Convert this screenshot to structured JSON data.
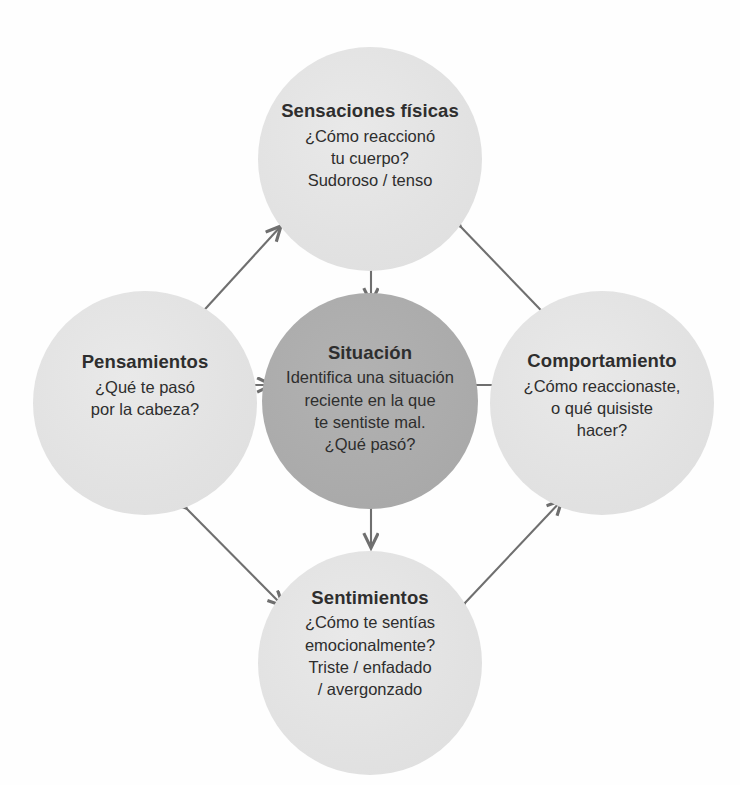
{
  "diagram": {
    "type": "cycle-diagram",
    "language": "es",
    "background_color": "#fefefe",
    "outer_circle_color": "#e2e2e2",
    "center_circle_color": "#ababab",
    "arrow_color": "#6f6f6f",
    "text_color": "#2e2e2e",
    "nodes": [
      {
        "id": "sensaciones-fisicas",
        "position": "top",
        "title": "Sensaciones físicas",
        "body": "¿Cómo reaccionó\ntu cuerpo?\nSudoroso / tenso"
      },
      {
        "id": "pensamientos",
        "position": "left",
        "title": "Pensamientos",
        "body": "¿Qué te pasó\npor la cabeza?"
      },
      {
        "id": "situacion",
        "position": "center",
        "title": "Situación",
        "body": "Identifica una situación\nreciente en la que\nte sentiste mal.\n¿Qué pasó?"
      },
      {
        "id": "comportamiento",
        "position": "right",
        "title": "Comportamiento",
        "body": "¿Cómo reaccionaste,\no qué quisiste\nhacer?"
      },
      {
        "id": "sentimientos",
        "position": "bottom",
        "title": "Sentimientos",
        "body": "¿Cómo te sentías\nemocionalmente?\nTriste / enfadado\n/ avergonzado"
      }
    ],
    "connectors": [
      {
        "id": "top-center",
        "style": "double-headed",
        "orientation": "vertical"
      },
      {
        "id": "left-center",
        "style": "double-headed",
        "orientation": "horizontal"
      },
      {
        "id": "right-center",
        "style": "double-headed",
        "orientation": "horizontal"
      },
      {
        "id": "bottom-center",
        "style": "double-headed",
        "orientation": "vertical"
      },
      {
        "id": "top-left",
        "style": "double-headed",
        "orientation": "diagonal"
      },
      {
        "id": "top-right",
        "style": "double-headed",
        "orientation": "diagonal"
      },
      {
        "id": "bottom-left",
        "style": "double-headed",
        "orientation": "diagonal"
      },
      {
        "id": "bottom-right",
        "style": "double-headed",
        "orientation": "diagonal"
      }
    ]
  }
}
